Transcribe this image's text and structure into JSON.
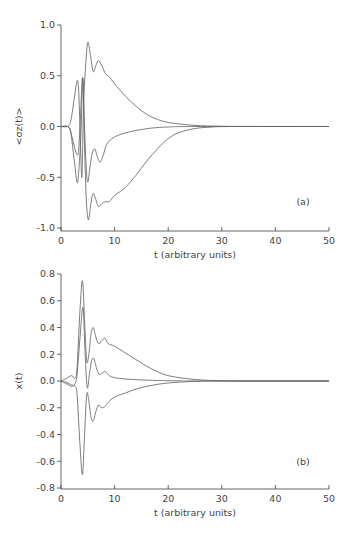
{
  "chart_data": [
    {
      "type": "line",
      "panel_label": "(a)",
      "title": "",
      "xlabel": "t (arbitrary units)",
      "ylabel": "<σz(t)>",
      "xlim": [
        0,
        50
      ],
      "ylim": [
        -1.0,
        1.0
      ],
      "xticks": [
        0,
        10,
        20,
        30,
        40,
        50
      ],
      "xtick_labels": [
        "0",
        "10",
        "20",
        "30",
        "40",
        "50"
      ],
      "yticks": [
        1.0,
        0.5,
        0.0,
        -0.5,
        -1.0
      ],
      "ytick_labels": [
        "1.0",
        "0.5",
        "0.0",
        "-0.5",
        "-1.0"
      ],
      "grid": false,
      "legend": null,
      "series": [
        {
          "name": "curve-upper",
          "points": [
            [
              0,
              0
            ],
            [
              1.2,
              0
            ],
            [
              1.8,
              0.05
            ],
            [
              2.4,
              0.25
            ],
            [
              3.0,
              0.45
            ],
            [
              3.3,
              0.35
            ],
            [
              3.6,
              -0.1
            ],
            [
              3.9,
              -0.5
            ],
            [
              4.2,
              0.2
            ],
            [
              4.6,
              0.6
            ],
            [
              5.0,
              0.83
            ],
            [
              5.5,
              0.7
            ],
            [
              6.0,
              0.54
            ],
            [
              6.5,
              0.6
            ],
            [
              7.0,
              0.65
            ],
            [
              7.6,
              0.6
            ],
            [
              8.3,
              0.52
            ],
            [
              9.0,
              0.49
            ],
            [
              10,
              0.42
            ],
            [
              12,
              0.3
            ],
            [
              14,
              0.2
            ],
            [
              16,
              0.12
            ],
            [
              18,
              0.07
            ],
            [
              20,
              0.04
            ],
            [
              23,
              0.02
            ],
            [
              26,
              0.008
            ],
            [
              30,
              0.002
            ],
            [
              35,
              0
            ],
            [
              50,
              0
            ]
          ]
        },
        {
          "name": "curve-middle",
          "points": [
            [
              0,
              0
            ],
            [
              1.2,
              0
            ],
            [
              1.8,
              -0.05
            ],
            [
              2.4,
              -0.18
            ],
            [
              3.0,
              -0.28
            ],
            [
              3.3,
              -0.22
            ],
            [
              3.6,
              0.05
            ],
            [
              4.0,
              0.48
            ],
            [
              4.3,
              0.1
            ],
            [
              4.7,
              -0.4
            ],
            [
              5.0,
              -0.55
            ],
            [
              5.4,
              -0.4
            ],
            [
              5.8,
              -0.27
            ],
            [
              6.3,
              -0.22
            ],
            [
              6.8,
              -0.3
            ],
            [
              7.3,
              -0.35
            ],
            [
              7.9,
              -0.28
            ],
            [
              8.5,
              -0.18
            ],
            [
              9.5,
              -0.12
            ],
            [
              11,
              -0.08
            ],
            [
              13,
              -0.05
            ],
            [
              15,
              -0.03
            ],
            [
              17,
              -0.015
            ],
            [
              20,
              -0.005
            ],
            [
              25,
              0
            ],
            [
              50,
              0
            ]
          ]
        },
        {
          "name": "curve-lower",
          "points": [
            [
              0,
              0
            ],
            [
              1.2,
              0
            ],
            [
              1.8,
              -0.05
            ],
            [
              2.4,
              -0.3
            ],
            [
              3.0,
              -0.55
            ],
            [
              3.3,
              -0.45
            ],
            [
              3.7,
              -0.1
            ],
            [
              4.1,
              0.48
            ],
            [
              4.4,
              -0.2
            ],
            [
              4.7,
              -0.7
            ],
            [
              5.1,
              -0.92
            ],
            [
              5.6,
              -0.75
            ],
            [
              6.0,
              -0.66
            ],
            [
              6.5,
              -0.72
            ],
            [
              7.0,
              -0.79
            ],
            [
              7.6,
              -0.76
            ],
            [
              8.3,
              -0.74
            ],
            [
              9.0,
              -0.74
            ],
            [
              10,
              -0.68
            ],
            [
              12,
              -0.6
            ],
            [
              14,
              -0.48
            ],
            [
              16,
              -0.34
            ],
            [
              18,
              -0.22
            ],
            [
              20,
              -0.12
            ],
            [
              22,
              -0.06
            ],
            [
              25,
              -0.02
            ],
            [
              28,
              -0.006
            ],
            [
              32,
              0
            ],
            [
              50,
              0
            ]
          ]
        }
      ]
    },
    {
      "type": "line",
      "panel_label": "(b)",
      "title": "",
      "xlabel": "t (arbitrary units)",
      "ylabel": "x(t)",
      "xlim": [
        0,
        50
      ],
      "ylim": [
        -0.8,
        0.8
      ],
      "xticks": [
        0,
        10,
        20,
        30,
        40,
        50
      ],
      "xtick_labels": [
        "0",
        "10",
        "20",
        "30",
        "40",
        "50"
      ],
      "yticks": [
        0.8,
        0.6,
        0.4,
        0.2,
        0.0,
        -0.2,
        -0.4,
        -0.6,
        -0.8
      ],
      "ytick_labels": [
        "0.8",
        "0.6",
        "0.4",
        "0.2",
        "0.0",
        "-0.2",
        "-0.4",
        "-0.6",
        "-0.8"
      ],
      "grid": false,
      "legend": null,
      "series": [
        {
          "name": "curve-upper",
          "points": [
            [
              0,
              0
            ],
            [
              1.0,
              0.02
            ],
            [
              2.0,
              0.04
            ],
            [
              2.6,
              0.02
            ],
            [
              3.0,
              0.1
            ],
            [
              3.5,
              0.5
            ],
            [
              4.0,
              0.75
            ],
            [
              4.4,
              0.45
            ],
            [
              4.8,
              0.15
            ],
            [
              5.2,
              0.2
            ],
            [
              5.6,
              0.35
            ],
            [
              6.0,
              0.4
            ],
            [
              6.5,
              0.33
            ],
            [
              7.0,
              0.28
            ],
            [
              7.6,
              0.3
            ],
            [
              8.2,
              0.32
            ],
            [
              8.8,
              0.28
            ],
            [
              10,
              0.26
            ],
            [
              12,
              0.21
            ],
            [
              14,
              0.16
            ],
            [
              16,
              0.11
            ],
            [
              18,
              0.07
            ],
            [
              20,
              0.04
            ],
            [
              23,
              0.02
            ],
            [
              26,
              0.008
            ],
            [
              30,
              0.002
            ],
            [
              35,
              0
            ],
            [
              50,
              0
            ]
          ]
        },
        {
          "name": "curve-middle",
          "points": [
            [
              0,
              0
            ],
            [
              1.0,
              -0.02
            ],
            [
              2.0,
              -0.04
            ],
            [
              2.6,
              -0.02
            ],
            [
              3.0,
              0.05
            ],
            [
              3.5,
              0.3
            ],
            [
              4.1,
              0.55
            ],
            [
              4.5,
              0.2
            ],
            [
              4.9,
              -0.05
            ],
            [
              5.3,
              0.05
            ],
            [
              5.7,
              0.15
            ],
            [
              6.1,
              0.17
            ],
            [
              6.6,
              0.1
            ],
            [
              7.1,
              0.05
            ],
            [
              7.7,
              0.06
            ],
            [
              8.3,
              0.07
            ],
            [
              9,
              0.04
            ],
            [
              10,
              0.025
            ],
            [
              12,
              0.015
            ],
            [
              15,
              0.008
            ],
            [
              18,
              0.004
            ],
            [
              22,
              0.001
            ],
            [
              26,
              0
            ],
            [
              50,
              0
            ]
          ]
        },
        {
          "name": "curve-lower",
          "points": [
            [
              0,
              0
            ],
            [
              1.0,
              -0.01
            ],
            [
              2.0,
              -0.03
            ],
            [
              2.6,
              -0.04
            ],
            [
              3.0,
              -0.1
            ],
            [
              3.5,
              -0.45
            ],
            [
              4.0,
              -0.7
            ],
            [
              4.4,
              -0.4
            ],
            [
              4.8,
              -0.1
            ],
            [
              5.2,
              -0.15
            ],
            [
              5.6,
              -0.27
            ],
            [
              6.0,
              -0.3
            ],
            [
              6.5,
              -0.23
            ],
            [
              7.0,
              -0.18
            ],
            [
              7.6,
              -0.2
            ],
            [
              8.2,
              -0.19
            ],
            [
              8.8,
              -0.16
            ],
            [
              10,
              -0.12
            ],
            [
              12,
              -0.09
            ],
            [
              14,
              -0.06
            ],
            [
              16,
              -0.04
            ],
            [
              18,
              -0.025
            ],
            [
              20,
              -0.015
            ],
            [
              23,
              -0.006
            ],
            [
              26,
              -0.002
            ],
            [
              30,
              0
            ],
            [
              50,
              0
            ]
          ]
        }
      ]
    }
  ]
}
